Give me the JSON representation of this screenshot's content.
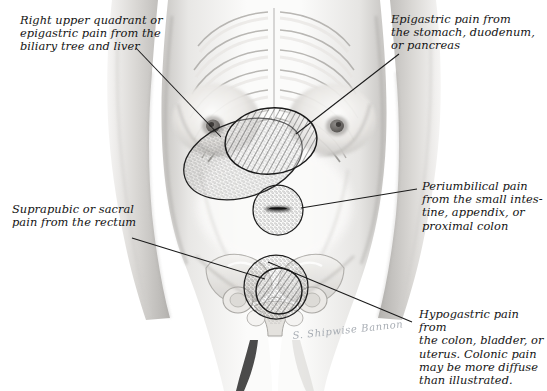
{
  "figure": {
    "signature": "S. Shipwise Bannon"
  },
  "labels": {
    "ruq": {
      "id": "right-upper-quadrant",
      "text": "Right upper quadrant or\nepigastric pain from the\nbiliary tree and liver"
    },
    "epigastric": {
      "id": "epigastric",
      "text": "Epigastric pain from\nthe stomach, duodenum,\nor pancreas"
    },
    "periumbilical": {
      "id": "periumbilical",
      "text": "Periumbilical pain\nfrom the small intes-\ntine, appendix, or\nproximal colon"
    },
    "suprapubic": {
      "id": "suprapubic-sacral",
      "text": "Suprapubic or sacral\npain from the rectum"
    },
    "hypogastric": {
      "id": "hypogastric",
      "text": "Hypogastric pain from\nthe colon, bladder, or\nuterus. Colonic pain\nmay be more diffuse\nthan illustrated."
    }
  },
  "regions": [
    {
      "name": "ruq-stippled-oval",
      "fill": "stipple",
      "cx": 243,
      "cy": 159,
      "rx": 61,
      "ry": 38,
      "rotate": -18
    },
    {
      "name": "epigastric-hatched-oval",
      "fill": "hatch",
      "cx": 271,
      "cy": 141,
      "rx": 46,
      "ry": 33,
      "rotate": -6
    },
    {
      "name": "periumbilical-stippled-circle",
      "fill": "stipple",
      "cx": 278,
      "cy": 210,
      "rx": 25,
      "ry": 25,
      "rotate": 0
    },
    {
      "name": "hypogastric-stippled-circle",
      "fill": "stipple",
      "cx": 276,
      "cy": 287,
      "rx": 32,
      "ry": 32,
      "rotate": 0
    },
    {
      "name": "suprapubic-hatched-circle",
      "fill": "hatch",
      "cx": 279,
      "cy": 291,
      "rx": 23,
      "ry": 23,
      "rotate": 0
    }
  ],
  "leaders": [
    {
      "name": "leader-ruq",
      "x1": 136,
      "y1": 48,
      "x2": 221,
      "y2": 137
    },
    {
      "name": "leader-epigastric",
      "x1": 399,
      "y1": 54,
      "x2": 296,
      "y2": 134
    },
    {
      "name": "leader-periumbilical",
      "x1": 417,
      "y1": 189,
      "x2": 301,
      "y2": 208
    },
    {
      "name": "leader-suprapubic",
      "x1": 132,
      "y1": 238,
      "x2": 265,
      "y2": 279
    },
    {
      "name": "leader-hypogastric",
      "x1": 412,
      "y1": 322,
      "x2": 268,
      "y2": 262
    }
  ],
  "colors": {
    "ink": "#141414",
    "leader": "#1a1a1a",
    "outline": "#2a2a2a",
    "skin_light": "#f7f6f4",
    "skin_mid": "#dedcd9",
    "skin_shadow": "#b9b7b4",
    "bone": "#cfcdc9",
    "background": "#ffffff"
  }
}
